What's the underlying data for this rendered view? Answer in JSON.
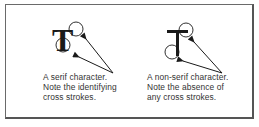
{
  "figure": {
    "left_panel": {
      "glyph": "T",
      "glyph_style": "serif",
      "caption_lines": [
        "A serif character.",
        "Note the identifying",
        "cross strokes."
      ]
    },
    "right_panel": {
      "glyph": "T",
      "glyph_style": "non-serif",
      "caption_lines": [
        "A non-serif character.",
        "Note the absence of",
        "any cross strokes."
      ]
    },
    "colors": {
      "ink": "#1a1a1a",
      "frame": "#555555",
      "text": "#333333"
    }
  }
}
